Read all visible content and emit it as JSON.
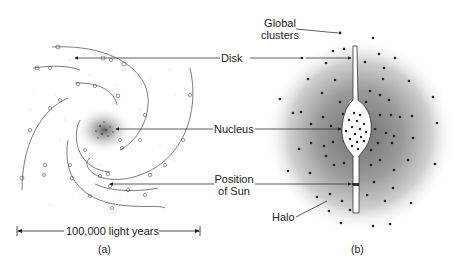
{
  "figure": {
    "panel_a": {
      "caption": "(a)",
      "view": "face-on spiral galaxy",
      "scale_bar_label": "100,000 light years"
    },
    "panel_b": {
      "caption": "(b)",
      "view": "edge-on galaxy with halo"
    },
    "labels": {
      "global_clusters_line1": "Global",
      "global_clusters_line2": "clusters",
      "disk": "Disk",
      "nucleus": "Nucleus",
      "position_of_sun_line1": "Position",
      "position_of_sun_line2": "of Sun",
      "halo": "Halo"
    },
    "colors": {
      "ink": "#222222",
      "halo_core": "#8a8a8a",
      "background": "#ffffff"
    }
  }
}
